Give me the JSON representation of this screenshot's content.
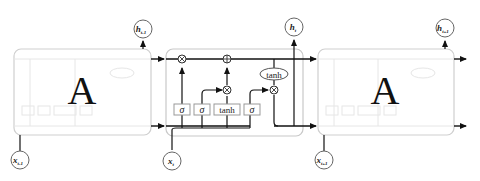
{
  "diagram": {
    "type": "LSTM chain",
    "cells": [
      {
        "id": "prev",
        "label": "A",
        "input": "x",
        "input_sub": "t-1",
        "output": "h",
        "output_sub": "t-1"
      },
      {
        "id": "current",
        "label": "",
        "input": "x",
        "input_sub": "t",
        "output": "h",
        "output_sub": "t"
      },
      {
        "id": "next",
        "label": "A",
        "input": "x",
        "input_sub": "t+1",
        "output": "h",
        "output_sub": "t+1"
      }
    ],
    "gates": [
      {
        "name": "forget-gate",
        "label": "σ"
      },
      {
        "name": "input-gate",
        "label": "σ"
      },
      {
        "name": "candidate-layer",
        "label": "tanh"
      },
      {
        "name": "output-gate",
        "label": "σ"
      }
    ],
    "pointwise_ops": {
      "multiply": "⊗",
      "add": "⊕",
      "tanh": "tanh"
    },
    "colors": {
      "line": "#222222",
      "box_border": "#c8c8c8",
      "faded": "#e2e2e2"
    }
  }
}
